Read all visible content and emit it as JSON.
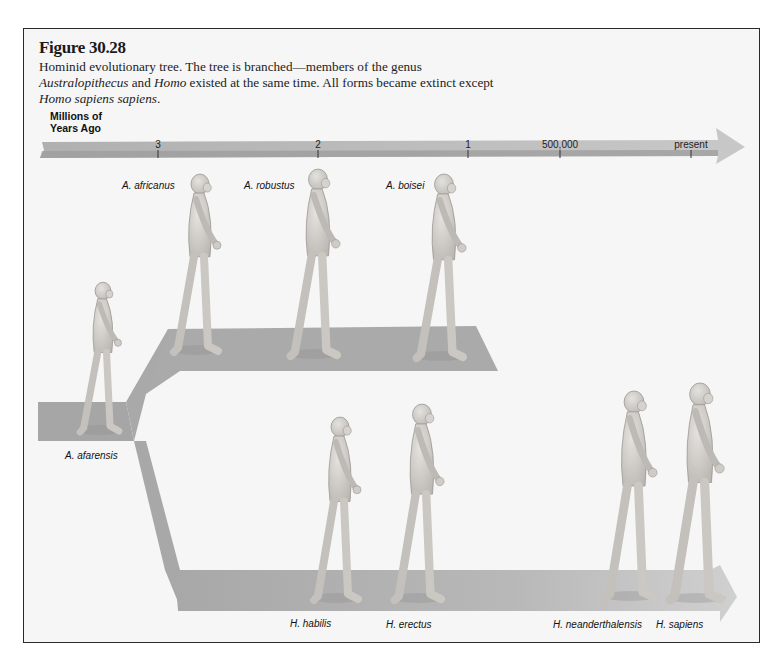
{
  "figure": {
    "title": "Figure 30.28",
    "caption_parts": [
      {
        "text": "Hominid evolutionary tree. The tree is branched—members of the genus ",
        "italic": false
      },
      {
        "text": "Australopithecus",
        "italic": true
      },
      {
        "text": " and ",
        "italic": false
      },
      {
        "text": "Homo",
        "italic": true
      },
      {
        "text": " existed at the same time. All forms became extinct except ",
        "italic": false
      },
      {
        "text": "Homo sapiens sapiens",
        "italic": true
      },
      {
        "text": ".",
        "italic": false
      }
    ]
  },
  "timeline": {
    "axis_title_line1": "Millions of",
    "axis_title_line2": "Years Ago",
    "ticks": [
      "3",
      "2",
      "1",
      "500,000",
      "present"
    ]
  },
  "branches": {
    "australopithecus": {
      "species": [
        "A. africanus",
        "A. robustus",
        "A. boisei"
      ]
    },
    "ancestor": "A. afarensis",
    "homo": {
      "species": [
        "H. habilis",
        "H. erectus",
        "H. neanderthalensis",
        "H. sapiens"
      ]
    }
  },
  "colors": {
    "platform": "#a9a9a9",
    "platform_light": "#c9c9c9",
    "timeline_bar": "#b9b9b9",
    "figure_skin": "#d2d0cc",
    "frame_border": "#2a2a2a"
  }
}
